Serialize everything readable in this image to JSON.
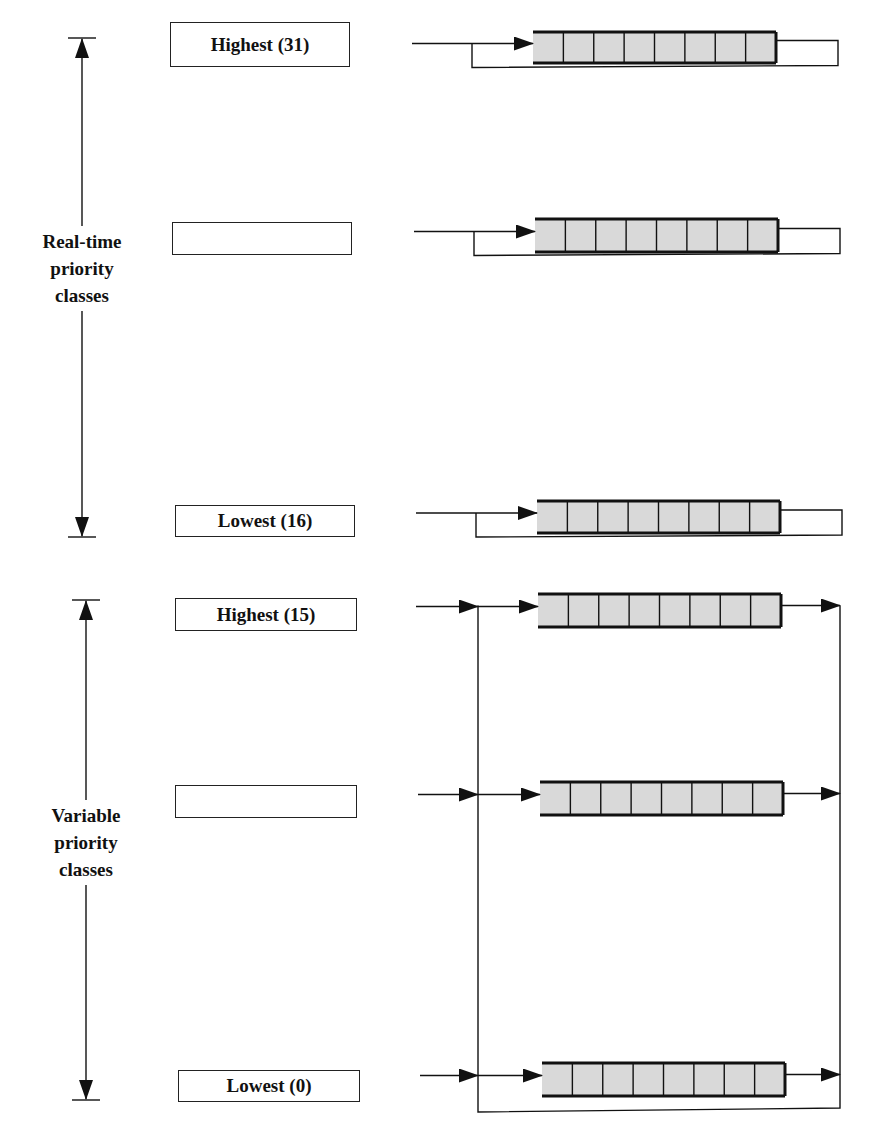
{
  "diagram": {
    "groups": [
      {
        "id": "real-time",
        "label_lines": [
          "Real-time",
          "priority",
          "classes"
        ],
        "axis": {
          "x": 82,
          "top": 38,
          "bottom": 537,
          "label_top": 226
        },
        "queue_style": "round-robin-self-loop"
      },
      {
        "id": "variable",
        "label_lines": [
          "Variable",
          "priority",
          "classes"
        ],
        "axis": {
          "x": 86,
          "top": 600,
          "bottom": 1100,
          "label_top": 800
        },
        "queue_style": "shared-feedback-bus"
      }
    ],
    "rows": [
      {
        "group": "real-time",
        "label": "Highest (31)",
        "box": [
          170,
          22,
          180,
          45
        ],
        "queue": [
          533,
          32,
          243,
          31
        ],
        "entry_x": 412
      },
      {
        "group": "real-time",
        "label": "",
        "box": [
          172,
          222,
          180,
          33
        ],
        "queue": [
          535,
          219,
          243,
          33
        ],
        "entry_x": 414
      },
      {
        "group": "real-time",
        "label": "Lowest (16)",
        "box": [
          175,
          505,
          180,
          32
        ],
        "queue": [
          537,
          501,
          243,
          32
        ],
        "entry_x": 416
      },
      {
        "group": "variable",
        "label": "Highest (15)",
        "box": [
          175,
          598,
          182,
          33
        ],
        "queue": [
          538,
          594,
          243,
          33
        ],
        "entry_x": 416
      },
      {
        "group": "variable",
        "label": "",
        "box": [
          175,
          785,
          182,
          33
        ],
        "queue": [
          540,
          782,
          243,
          33
        ],
        "entry_x": 418
      },
      {
        "group": "variable",
        "label": "Lowest (0)",
        "box": [
          178,
          1070,
          182,
          32
        ],
        "queue": [
          542,
          1063,
          243,
          33
        ],
        "entry_x": 420
      }
    ],
    "queue_slots": 8,
    "variable_bus": {
      "left_x": 478,
      "right_x": 840,
      "bottom_y": 1112
    },
    "colors": {
      "line": "#111111",
      "queue_fill": "#d9d9d9",
      "background": "#ffffff"
    }
  }
}
